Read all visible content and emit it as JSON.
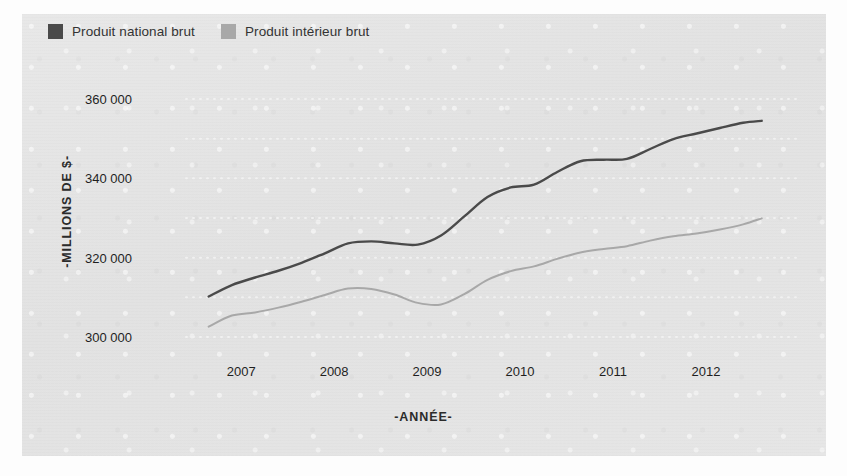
{
  "chart_data": {
    "type": "line",
    "title": "",
    "xlabel": "-ANNÉE-",
    "ylabel": "-MILLIONS DE $-",
    "grid": true,
    "legend_position": "top-left",
    "xlim": [
      2006.6,
      2012.7
    ],
    "ylim": [
      295000,
      365000
    ],
    "ytick_labels": [
      "360 000",
      "340 000",
      "320 000",
      "300 000"
    ],
    "ytick_values": [
      360000,
      340000,
      320000,
      300000
    ],
    "xtick_labels": [
      "2007",
      "2008",
      "2009",
      "2010",
      "2011",
      "2012"
    ],
    "xtick_values": [
      2007,
      2008,
      2009,
      2010,
      2011,
      2012
    ],
    "x": [
      2006.65,
      2006.9,
      2007.15,
      2007.4,
      2007.65,
      2007.9,
      2008.15,
      2008.4,
      2008.65,
      2008.9,
      2009.15,
      2009.4,
      2009.65,
      2009.9,
      2010.15,
      2010.4,
      2010.65,
      2010.9,
      2011.15,
      2011.4,
      2011.65,
      2011.9,
      2012.15,
      2012.4,
      2012.6
    ],
    "series": [
      {
        "name": "Produit national brut",
        "color": "#4a4a4a",
        "values": [
          310200,
          313100,
          315000,
          316700,
          318700,
          321100,
          323600,
          324100,
          323600,
          323300,
          325600,
          330400,
          335300,
          337700,
          338400,
          341600,
          344300,
          344700,
          344900,
          347400,
          349900,
          351300,
          352700,
          354000,
          354500
        ]
      },
      {
        "name": "Produit intérieur brut",
        "color": "#a8a8a8",
        "values": [
          302600,
          305400,
          306200,
          307400,
          308900,
          310600,
          312200,
          312100,
          310700,
          308600,
          308200,
          310800,
          314400,
          316600,
          317800,
          319700,
          321300,
          322200,
          322900,
          324300,
          325400,
          326100,
          327100,
          328400,
          329900
        ]
      }
    ]
  },
  "legend": {
    "items": [
      {
        "label": "Produit national brut",
        "color": "#4a4a4a",
        "swatch_name": "legend-swatch-pnb"
      },
      {
        "label": "Produit intérieur brut",
        "color": "#a8a8a8",
        "swatch_name": "legend-swatch-pib"
      }
    ]
  },
  "colors": {
    "panel_background": "#e4e4e4",
    "page_background": "#fdfdfd",
    "series_dark": "#4a4a4a",
    "series_light": "#a8a8a8",
    "gridline": "#f2f2f2",
    "text": "#1f1f1f"
  }
}
